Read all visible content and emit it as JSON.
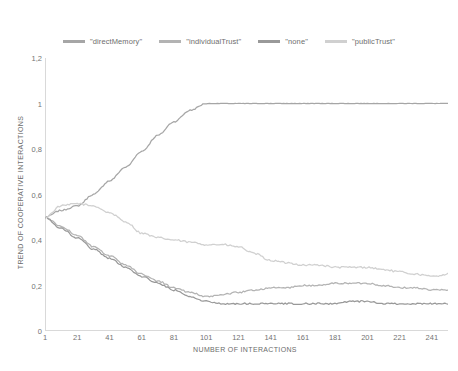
{
  "chart_data": {
    "type": "line",
    "title": "",
    "xlabel": "NUMBER OF INTERACTIONS",
    "ylabel": "TREND OF COOPERATIVE INTERACTIONS",
    "xlim": [
      1,
      251
    ],
    "ylim": [
      0,
      1.2
    ],
    "grid": false,
    "legend_position": "top-center",
    "x_ticks": [
      1,
      21,
      41,
      61,
      81,
      101,
      121,
      141,
      161,
      181,
      201,
      221,
      241
    ],
    "y_ticks": [
      "0",
      "0,2",
      "0,4",
      "0,6",
      "0,8",
      "1",
      "1,2"
    ],
    "y_tick_values": [
      0,
      0.2,
      0.4,
      0.6,
      0.8,
      1.0,
      1.2
    ],
    "x": [
      1,
      11,
      21,
      31,
      41,
      51,
      61,
      71,
      81,
      91,
      101,
      111,
      121,
      131,
      141,
      151,
      161,
      171,
      181,
      191,
      201,
      211,
      221,
      231,
      241,
      251
    ],
    "series": [
      {
        "name": "\"directMemory\"",
        "color": "#a6a6a6",
        "values": [
          0.5,
          0.53,
          0.55,
          0.6,
          0.66,
          0.72,
          0.79,
          0.86,
          0.92,
          0.97,
          1.0,
          1.0,
          1.0,
          1.0,
          1.0,
          1.0,
          1.0,
          1.0,
          1.0,
          1.0,
          1.0,
          1.0,
          1.0,
          1.0,
          1.0,
          1.0
        ]
      },
      {
        "name": "\"individualTrust\"",
        "color": "#b3b3b3",
        "values": [
          0.5,
          0.46,
          0.42,
          0.37,
          0.33,
          0.29,
          0.25,
          0.22,
          0.19,
          0.17,
          0.15,
          0.16,
          0.17,
          0.18,
          0.19,
          0.19,
          0.2,
          0.2,
          0.21,
          0.21,
          0.21,
          0.2,
          0.19,
          0.19,
          0.18,
          0.18
        ]
      },
      {
        "name": "\"none\"",
        "color": "#999999",
        "values": [
          0.5,
          0.45,
          0.41,
          0.36,
          0.32,
          0.28,
          0.24,
          0.21,
          0.18,
          0.15,
          0.13,
          0.12,
          0.12,
          0.12,
          0.12,
          0.12,
          0.12,
          0.12,
          0.12,
          0.13,
          0.13,
          0.12,
          0.12,
          0.12,
          0.12,
          0.12
        ]
      },
      {
        "name": "\"publicTrust\"",
        "color": "#d0d0d0",
        "values": [
          0.5,
          0.55,
          0.56,
          0.55,
          0.52,
          0.48,
          0.43,
          0.41,
          0.4,
          0.39,
          0.38,
          0.38,
          0.37,
          0.34,
          0.31,
          0.3,
          0.29,
          0.29,
          0.28,
          0.28,
          0.28,
          0.27,
          0.26,
          0.25,
          0.24,
          0.25
        ]
      }
    ]
  },
  "legend": {
    "entries": [
      {
        "label": "\"directMemory\""
      },
      {
        "label": "\"individualTrust\""
      },
      {
        "label": "\"none\""
      },
      {
        "label": "\"publicTrust\""
      }
    ]
  },
  "caption": {
    "text": ""
  }
}
